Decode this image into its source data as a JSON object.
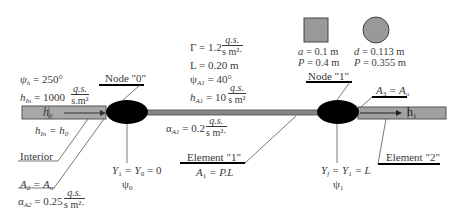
{
  "diagram": {
    "colors": {
      "bar_fill": "#a8a8a8",
      "bar_stroke": "#555555",
      "node_fill": "#000000",
      "fin_fill": "#888888",
      "shape_fill": "#999999",
      "text": "#3a3a3a"
    },
    "left_params": {
      "psi_h": "ψh = 250°",
      "psi_h_sym": "ψ",
      "psi_h_sub": "h",
      "psi_h_val": " = 250°",
      "h_in_sym": "h",
      "h_in_sub": "In",
      "h_in_val": " = 1000",
      "h_in_unit_num": "q.s.",
      "h_in_unit_den": "s.m²"
    },
    "left_bar": {
      "label": "h",
      "label_sub": "0",
      "below_label": "hIn = h0",
      "below_sym": "h",
      "below_sub": "In",
      "below_eq": " = h",
      "below_sub2": "0"
    },
    "interior_label": "Interior",
    "area_left": {
      "a2": "A",
      "a2_sub": "2",
      "a2_eq": " = A",
      "a2_sub2": "o",
      "alpha_sym": "α",
      "alpha_sub": "A2",
      "alpha_val": " = 0.25",
      "alpha_unit_num": "q.s.",
      "alpha_unit_den": "s m²·"
    },
    "node0": {
      "label": "Node \"0\"",
      "y_eq": "Y",
      "y_sub": "1",
      "y_eq2": " = Y",
      "y_sub2": "0",
      "y_eq3": " = 0",
      "psi": "ψ",
      "psi_sub": "0"
    },
    "center_params": {
      "gamma": "Γ = 1.2",
      "gamma_unit_num": "q.s.",
      "gamma_unit_den": "s m²·",
      "length": "L = 0.20 m",
      "psi_sym": "ψ",
      "psi_sub": "A1",
      "psi_val": " = 40°",
      "h_sym": "h",
      "h_sub": "A1",
      "h_val": " = 10",
      "h_unit_num": "q.s.",
      "h_unit_den": "s m²"
    },
    "alpha_a1": {
      "sym": "α",
      "sub": "A1",
      "val": " = 0.2",
      "unit_num": "q.s.",
      "unit_den": "s m²·"
    },
    "element1": {
      "label": "Element \"1\"",
      "formula_a": "A",
      "formula_sub": "1",
      "formula_rest": " = P.L"
    },
    "node1": {
      "label": "Node \"1\"",
      "y_a": "Y",
      "y_sub_f": "f",
      "y_b": " = Y",
      "y_sub_1": "1",
      "y_c": " = L",
      "psi": "ψ",
      "psi_sub": "1"
    },
    "area_right": {
      "a3": "A",
      "a3_sub": "3",
      "a3_eq": " = A",
      "a3_sub2": "o"
    },
    "right_bar": {
      "label": "h",
      "label_sub": "1"
    },
    "element2": {
      "label": "Element \"2\""
    },
    "square_shape": {
      "side": "a = 0.1 m",
      "side_sym": "a",
      "side_val": " = 0.1 m",
      "perimeter_sym": "P",
      "perimeter_val": " = 0.4 m"
    },
    "circle_shape": {
      "diameter_sym": "d",
      "diameter_val": " = 0.113 m",
      "perimeter_sym": "P",
      "perimeter_val": " = 0.355 m"
    }
  }
}
